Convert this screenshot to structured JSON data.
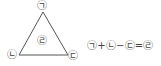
{
  "diagram": {
    "shape": "triangle",
    "vertices": {
      "top": "㉠",
      "bottom_left": "㉡",
      "bottom_right": "㉢"
    },
    "center": "㉣",
    "stroke_color": "#555555"
  },
  "equation": {
    "term1": "㉠",
    "op1": "+",
    "term2": "㉡",
    "op2": "−",
    "term3": "㉢",
    "op3": "=",
    "result": "㉣"
  }
}
